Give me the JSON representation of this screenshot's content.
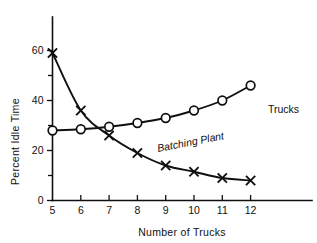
{
  "chart_data": {
    "type": "line",
    "title": "",
    "xlabel": "Number of Trucks",
    "ylabel": "Percent Idle Time",
    "x": [
      5,
      6,
      7,
      8,
      9,
      10,
      11,
      12
    ],
    "xlim": [
      5,
      12.6
    ],
    "ylim": [
      0,
      66
    ],
    "grid": false,
    "legend_position": "inline-annotations",
    "xticks": [
      "5",
      "6",
      "7",
      "8",
      "9",
      "10",
      "11",
      "12"
    ],
    "yticks": [
      "0",
      "20",
      "40",
      "60"
    ],
    "yticks_minor": [
      10,
      30,
      50
    ],
    "series": [
      {
        "name": "Trucks",
        "marker": "circle",
        "label": "Trucks",
        "label_style": "upright",
        "values": [
          28,
          28.5,
          29.5,
          31,
          33,
          36,
          40,
          46
        ]
      },
      {
        "name": "Batching Plant",
        "marker": "x",
        "label": "Batching Plant",
        "label_style": "italic",
        "values": [
          59,
          36,
          26,
          19,
          14,
          11.5,
          9,
          8
        ]
      }
    ]
  },
  "colors": {
    "ink": "#101010",
    "background": "#ffffff"
  }
}
